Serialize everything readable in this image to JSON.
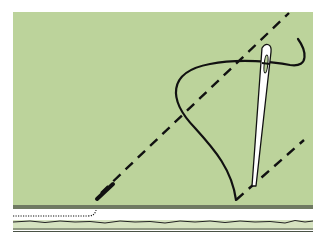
{
  "diagram": {
    "colors": {
      "background": "#ffffff",
      "fabric_fill": "#bcd39b",
      "fabric_edge": "#6f7a62",
      "strip_fill": "#d6e3c0",
      "line": "#111111",
      "needle": "#ffffff"
    },
    "elements": [
      {
        "name": "fabric-panel",
        "label": "Fabric"
      },
      {
        "name": "fold-edge",
        "label": "Fold edge"
      },
      {
        "name": "dashed-stitch-line-upper",
        "label": "Stitch guide line"
      },
      {
        "name": "dashed-stitch-line-lower",
        "label": "Stitch guide line"
      },
      {
        "name": "thread",
        "label": "Thread"
      },
      {
        "name": "needle",
        "label": "Needle"
      },
      {
        "name": "underlayer-stitches",
        "label": "Hidden stitches (dotted)"
      },
      {
        "name": "raw-edge",
        "label": "Raw edge"
      }
    ]
  }
}
